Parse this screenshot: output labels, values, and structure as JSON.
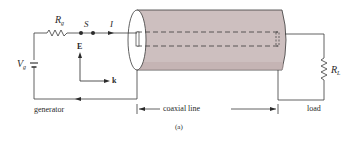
{
  "figure": {
    "caption": "(a)",
    "sections": {
      "generator": "generator",
      "coaxial_line": "coaxial line",
      "load": "load"
    },
    "labels": {
      "source_voltage": {
        "main": "V",
        "sub": "g"
      },
      "source_resistance": {
        "main": "R",
        "sub": "g"
      },
      "switch": "S",
      "current": "I",
      "electric_field": "E",
      "propagation": "k",
      "load_resistance": {
        "main": "R",
        "sub": "L"
      }
    },
    "colors": {
      "line": "#3a3a3a",
      "cylinder_fill": "#cdbfbf",
      "cylinder_shade": "#bfaeae",
      "background": "#ffffff"
    }
  }
}
